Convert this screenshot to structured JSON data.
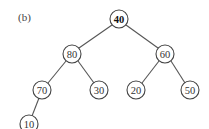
{
  "figure": {
    "panel_label": "(b)",
    "type": "binary-tree",
    "root": "40"
  },
  "nodes": [
    {
      "id": "n40",
      "label": "40",
      "x": 119,
      "y": 19,
      "bold": true
    },
    {
      "id": "n80",
      "label": "80",
      "x": 72,
      "y": 54
    },
    {
      "id": "n60",
      "label": "60",
      "x": 165,
      "y": 54
    },
    {
      "id": "n70",
      "label": "70",
      "x": 42,
      "y": 90
    },
    {
      "id": "n30",
      "label": "30",
      "x": 99,
      "y": 90
    },
    {
      "id": "n20",
      "label": "20",
      "x": 136,
      "y": 90
    },
    {
      "id": "n50",
      "label": "50",
      "x": 190,
      "y": 90
    },
    {
      "id": "n10",
      "label": "10",
      "x": 29,
      "y": 124
    }
  ],
  "edges": [
    {
      "from": "40",
      "to": "80"
    },
    {
      "from": "40",
      "to": "60"
    },
    {
      "from": "80",
      "to": "70"
    },
    {
      "from": "80",
      "to": "30"
    },
    {
      "from": "60",
      "to": "20"
    },
    {
      "from": "60",
      "to": "50"
    },
    {
      "from": "70",
      "to": "10"
    }
  ]
}
